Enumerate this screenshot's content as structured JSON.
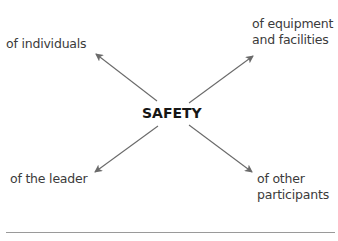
{
  "diagram": {
    "center": {
      "label": "SAFETY"
    },
    "nodes": [
      {
        "id": "top-left",
        "lines": [
          "of individuals"
        ]
      },
      {
        "id": "top-right",
        "lines": [
          "of equipment",
          "and facilities"
        ]
      },
      {
        "id": "bottom-left",
        "lines": [
          "of the leader"
        ]
      },
      {
        "id": "bottom-right",
        "lines": [
          "of other",
          "participants"
        ]
      }
    ],
    "edges": [
      {
        "from": "SAFETY",
        "to": "of individuals"
      },
      {
        "from": "SAFETY",
        "to": "of equipment and facilities"
      },
      {
        "from": "SAFETY",
        "to": "of the leader"
      },
      {
        "from": "SAFETY",
        "to": "of other participants"
      }
    ],
    "colors": {
      "text": "#3b3b3b",
      "center_text": "#161616",
      "arrow": "#6a6a6a",
      "rule": "#9a9a9a"
    }
  }
}
